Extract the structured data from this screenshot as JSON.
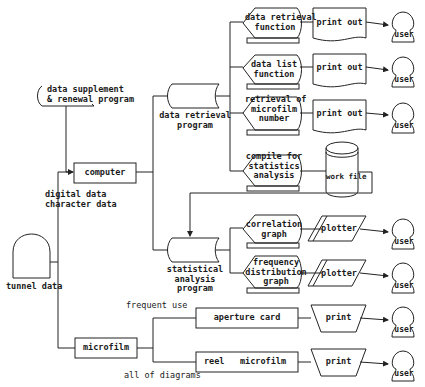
{
  "nodes": {
    "tunnel_data": "tunnel data",
    "data_supplement": "data supplement\n& renewal program",
    "computer": "computer",
    "digital_data": "digital data\ncharacter data",
    "microfilm": "microfilm",
    "data_retrieval_program": "data retrieval\nprogram",
    "statistical_analysis_program": "statistical\nanalysis\nprogram",
    "data_retrieval_function": "data retrieval\nfunction",
    "data_list_function": "data list\nfunction",
    "retrieval_microfilm_number": "retrieval of\nmicrofilm\nnumber",
    "compile_statistics": "compile for\nstatistics\nanalysis",
    "work_file": "work file",
    "correlation_graph": "correlation\ngraph",
    "frequency_graph": "frequency\ndistribution\ngraph",
    "print_out": "print out",
    "plotter": "plotter",
    "user": "user",
    "frequent_use": "frequent use",
    "all_of_diagrams": "all of diagrams",
    "aperture_card": "aperture card",
    "reel": "reel",
    "reel_microfilm": "microfilm",
    "print": "print"
  }
}
